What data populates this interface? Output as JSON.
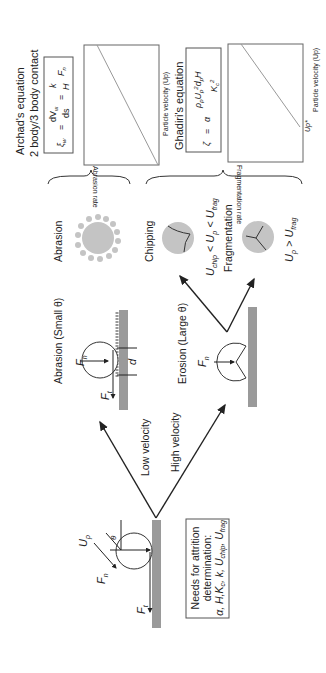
{
  "orientation": "rotated-90-ccw",
  "colors": {
    "gray_surface": "#9a9a9a",
    "particle_fill": "#c4c4c4",
    "line": "#222222",
    "chart_line": "#999999"
  },
  "left": {
    "needs_box": {
      "line1": "Needs for attrition",
      "line2": "determination:",
      "line3": "α, H,K",
      "line3_c": "c",
      "line3_rest": ", k, U",
      "line3_chip": "chip",
      "line3_sep": ", U",
      "line3_frag": "frag"
    },
    "labels": {
      "Up": "U",
      "Up_sub": "p",
      "theta": "θ",
      "Fn": "F",
      "Fn_sub": "n",
      "Ft": "F",
      "Ft_sub": "t"
    }
  },
  "arrows": {
    "low": "Low velocity",
    "high": "High velocity"
  },
  "middle": {
    "abrasion_title": "Abrasion (Small θ)",
    "erosion_title": "Erosion (Large θ)",
    "d_label": "d",
    "Fn": "F",
    "Fn_sub": "n",
    "Ft": "F",
    "Ft_sub": "t"
  },
  "outcomes": {
    "abrasion": "Abrasion",
    "chipping": "Chipping",
    "chipping_cond": {
      "a": "U",
      "a_sub": "chip",
      "b": " < U",
      "b_sub": "p",
      "c": " < U",
      "c_sub": "frag"
    },
    "fragmentation": "Fragmentation",
    "frag_cond": {
      "a": "U",
      "a_sub": "p",
      "b": " > U",
      "b_sub": "frag"
    }
  },
  "right": {
    "archad": {
      "title1": "Archad's equation",
      "title2": "2 body/3 body contact",
      "eq": "ξw = dVw/ds = k/H · Fn"
    },
    "ghadiri": {
      "title": "Ghadiri's equation",
      "eq": "ζ = α ρp Up² dp H / Kc²"
    },
    "abrasion_chart": {
      "ylabel": "Abrasion rate",
      "xlabel": "Particle velocity (Up)"
    },
    "frag_chart": {
      "ylabel": "Fragmentation rate",
      "xlabel": "Particle velocity (Up)",
      "threshold": "Up*"
    }
  }
}
